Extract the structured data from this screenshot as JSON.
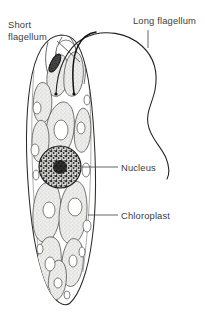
{
  "figure": {
    "background_color": "#ffffff",
    "width": 205,
    "height": 313
  },
  "labels": [
    {
      "id": "short-flagellum",
      "lines": [
        "Short",
        "flagellum"
      ],
      "text": "Short flagellum",
      "x": 8,
      "y": 28,
      "align": "start",
      "leader": "M 57 41 L 80 62"
    },
    {
      "id": "long-flagellum",
      "lines": [
        "Long flagellum"
      ],
      "text": "Long flagellum",
      "x": 133,
      "y": 24,
      "align": "start",
      "leader": "M 148 30 L 148 48"
    },
    {
      "id": "nucleus",
      "lines": [
        "Nucleus"
      ],
      "text": "Nucleus",
      "x": 121,
      "y": 171,
      "align": "start",
      "leader": "M 82 167 L 118 167"
    },
    {
      "id": "chloroplast",
      "lines": [
        "Chloroplast"
      ],
      "text": "Chloroplast",
      "x": 121,
      "y": 219,
      "align": "start",
      "leader": "M 88 215 L 118 215"
    }
  ],
  "structures": {
    "cell_membrane": {
      "name": "pellicle / cell membrane",
      "outline": "M 61 35 C 46 36 35 52 30 86 C 25 120 26 160 29 196 C 32 232 38 266 48 288 C 55 302 64 308 70 303 C 79 295 88 272 92 240 C 97 205 96 160 93 120 C 90 80 84 52 75 41 C 71 36 66 35 61 35 Z"
    },
    "reservoir": {
      "name": "reservoir and gullet"
    },
    "nucleus": {
      "name": "nucleus",
      "cx": 60,
      "cy": 167,
      "r": 21
    },
    "stigma": {
      "name": "stigma (eyespot)",
      "cx": 55,
      "cy": 63
    },
    "long_flagellum": {
      "name": "long flagellum",
      "path": "M 56 94 C 57 70 66 48 84 38 C 104 28 128 33 142 46 C 155 58 158 74 155 90 C 152 104 146 112 148 124 C 150 138 161 146 166 158 C 170 168 169 175 167 179"
    },
    "short_flagellum": {
      "name": "short flagellum",
      "path": "M 74 94 C 72 76 72 58 78 46 C 82 38 89 33 96 32"
    },
    "chloroplasts": [
      {
        "path": "M 57 56 C 50 60 46 72 47 84 C 48 94 54 99 60 95 C 67 90 70 76 68 64 C 66 56 62 53 57 56 Z"
      },
      {
        "path": "M 72 53 C 66 58 63 72 64 85 C 65 95 71 99 77 94 C 83 88 85 72 82 60 C 80 53 76 50 72 53 Z"
      },
      {
        "path": "M 38 85 C 33 92 32 106 35 116 C 38 124 44 125 48 119 C 53 111 53 95 49 87 C 46 82 41 81 38 85 Z"
      },
      {
        "path": "M 58 104 C 49 110 44 128 46 144 C 48 157 57 161 65 153 C 74 143 77 122 72 109 C 69 102 63 100 58 104 Z"
      },
      {
        "path": "M 80 110 C 75 116 73 132 75 144 C 77 153 83 155 87 148 C 92 139 92 120 88 112 C 86 108 82 107 80 110 Z"
      },
      {
        "path": "M 36 124 C 31 132 31 148 34 157 C 37 164 43 163 46 156 C 50 147 50 131 46 124 C 43 119 39 119 36 124 Z"
      },
      {
        "path": "M 42 185 C 34 192 31 214 34 230 C 37 243 46 246 53 237 C 61 226 63 202 58 189 C 55 182 47 180 42 185 Z"
      },
      {
        "path": "M 70 184 C 61 192 57 214 60 231 C 63 245 73 248 80 238 C 88 226 89 201 84 188 C 81 181 75 179 70 184 Z"
      },
      {
        "path": "M 44 240 C 37 248 35 268 38 281 C 41 291 49 293 55 285 C 62 275 63 254 59 243 C 56 236 48 235 44 240 Z"
      },
      {
        "path": "M 69 241 C 62 249 60 268 63 279 C 66 288 73 289 78 281 C 84 271 85 253 81 244 C 78 238 72 237 69 241 Z"
      },
      {
        "path": "M 55 262 C 49 268 47 283 49 293 C 51 301 58 302 62 295 C 67 287 68 271 64 264 C 62 260 57 259 55 262 Z"
      }
    ],
    "pyrenoids": [
      {
        "cx": 61,
        "cy": 130,
        "rx": 7,
        "ry": 10
      },
      {
        "cx": 81,
        "cy": 128,
        "rx": 4,
        "ry": 6
      },
      {
        "cx": 49,
        "cy": 210,
        "rx": 6,
        "ry": 8
      },
      {
        "cx": 75,
        "cy": 207,
        "rx": 7,
        "ry": 9
      },
      {
        "cx": 50,
        "cy": 264,
        "rx": 5,
        "ry": 7
      },
      {
        "cx": 73,
        "cy": 261,
        "rx": 4,
        "ry": 6
      },
      {
        "cx": 58,
        "cy": 283,
        "rx": 4,
        "ry": 5
      }
    ],
    "vacuoles": [
      {
        "cx": 37,
        "cy": 108,
        "rx": 4,
        "ry": 6
      },
      {
        "cx": 35,
        "cy": 150,
        "rx": 4,
        "ry": 6
      },
      {
        "cx": 87,
        "cy": 100,
        "rx": 3,
        "ry": 5
      },
      {
        "cx": 86,
        "cy": 170,
        "rx": 4,
        "ry": 7
      },
      {
        "cx": 36,
        "cy": 175,
        "rx": 3,
        "ry": 5
      },
      {
        "cx": 87,
        "cy": 226,
        "rx": 4,
        "ry": 6
      },
      {
        "cx": 40,
        "cy": 249,
        "rx": 3,
        "ry": 5
      },
      {
        "cx": 82,
        "cy": 252,
        "rx": 3,
        "ry": 5
      },
      {
        "cx": 67,
        "cy": 295,
        "rx": 3,
        "ry": 4
      },
      {
        "cx": 47,
        "cy": 291,
        "rx": 3,
        "ry": 4
      }
    ]
  },
  "colors": {
    "outline": "#2b2b2b",
    "inner_line": "#4a4a4a",
    "label_text": "#3d3d3d",
    "leader_line": "#565656",
    "chloroplast_fill": "#e8e8e6",
    "nucleus_fill": "#4a4a4a",
    "background": "#ffffff"
  }
}
